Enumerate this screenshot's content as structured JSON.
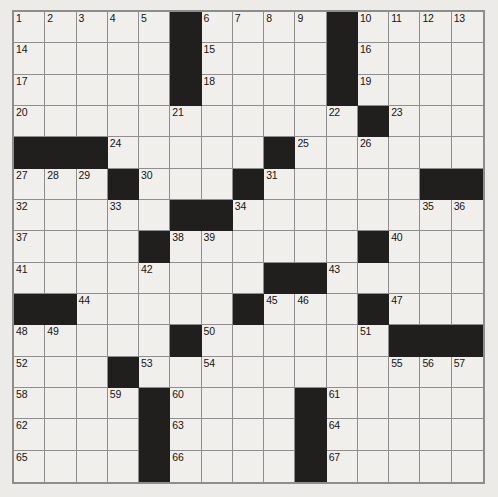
{
  "puzzle": {
    "title": "Crossword Grid",
    "rows": 15,
    "cols": 15,
    "colors": {
      "page_background": "#edebe7",
      "cell_background": "#f1efeb",
      "block_color": "#211f1e",
      "grid_line": "#8e8e8e",
      "border": "#8d8d8d",
      "number_color": "#151413"
    },
    "legend": {
      "cell_open": "open letter square",
      "cell_block": "blocked (black) square"
    },
    "grid": [
      [
        "1",
        "2",
        "3",
        "4",
        "5",
        "#",
        "6",
        "7",
        "8",
        "9",
        "#",
        "10",
        "11",
        "12",
        "13"
      ],
      [
        "14",
        "",
        "",
        "",
        "",
        "#",
        "15",
        "",
        "",
        "",
        "#",
        "16",
        "",
        "",
        ""
      ],
      [
        "17",
        "",
        "",
        "",
        "",
        "#",
        "18",
        "",
        "",
        "",
        "#",
        "19",
        "",
        "",
        ""
      ],
      [
        "20",
        "",
        "",
        "",
        "",
        "21",
        "",
        "",
        "",
        "",
        "22",
        "#",
        "23",
        "",
        ""
      ],
      [
        "#",
        "#",
        "#",
        "24",
        "",
        "",
        "",
        "",
        "#",
        "25",
        "",
        "26",
        "",
        "",
        ""
      ],
      [
        "27",
        "28",
        "29",
        "#",
        "30",
        "",
        "",
        "#",
        "31",
        "",
        "",
        "",
        "",
        "#",
        "#"
      ],
      [
        "32",
        "",
        "",
        "33",
        "",
        "#",
        "#",
        "34",
        "",
        "",
        "",
        "",
        "",
        "35",
        "36"
      ],
      [
        "37",
        "",
        "",
        "",
        "#",
        "38",
        "39",
        "",
        "",
        "",
        "",
        "#",
        "40",
        "",
        ""
      ],
      [
        "41",
        "",
        "",
        "",
        "42",
        "",
        "",
        "",
        "#",
        "#",
        "43",
        "",
        "",
        "",
        ""
      ],
      [
        "#",
        "#",
        "44",
        "",
        "",
        "",
        "",
        "#",
        "45",
        "46",
        "",
        "#",
        "47",
        "",
        ""
      ],
      [
        "48",
        "49",
        "",
        "",
        "",
        "#",
        "50",
        "",
        "",
        "",
        "",
        "51",
        "#",
        "#",
        "#"
      ],
      [
        "52",
        "",
        "",
        "#",
        "53",
        "",
        "54",
        "",
        "",
        "",
        "",
        "",
        "55",
        "56",
        "57"
      ],
      [
        "58",
        "",
        "",
        "59",
        "#",
        "60",
        "",
        "",
        "",
        "#",
        "61",
        "",
        "",
        "",
        ""
      ],
      [
        "62",
        "",
        "",
        "",
        "#",
        "63",
        "",
        "",
        "",
        "#",
        "64",
        "",
        "",
        "",
        ""
      ],
      [
        "65",
        "",
        "",
        "",
        "#",
        "66",
        "",
        "",
        "",
        "#",
        "67",
        "",
        "",
        "",
        ""
      ]
    ]
  }
}
